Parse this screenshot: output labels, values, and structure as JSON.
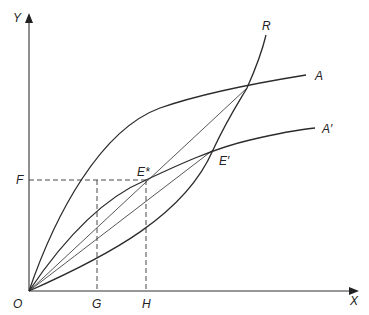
{
  "diagram": {
    "axes": {
      "y_label": "Y",
      "x_label": "X",
      "origin_label": "O"
    },
    "curves": {
      "A": "A",
      "A_prime": "A′",
      "R": "R"
    },
    "points": {
      "E_star": "E*",
      "E_prime": "E′"
    },
    "guides": {
      "F": "F",
      "G": "G",
      "H": "H"
    },
    "colors": {
      "line": "#2b2b2b",
      "background": "#ffffff"
    }
  }
}
